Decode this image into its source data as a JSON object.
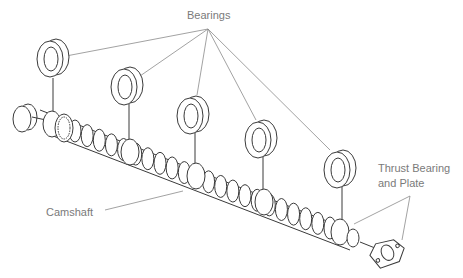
{
  "diagram": {
    "labels": {
      "bearings": "Bearings",
      "camshaft": "Camshaft",
      "thrust_line1": "Thrust Bearing",
      "thrust_line2": "and Plate"
    },
    "parts": [
      {
        "id": "bearing-1",
        "name": "Bearing"
      },
      {
        "id": "bearing-2",
        "name": "Bearing"
      },
      {
        "id": "bearing-3",
        "name": "Bearing"
      },
      {
        "id": "bearing-4",
        "name": "Bearing"
      },
      {
        "id": "bearing-5",
        "name": "Bearing"
      },
      {
        "id": "end-plug",
        "name": "Plug"
      },
      {
        "id": "camshaft",
        "name": "Camshaft"
      },
      {
        "id": "thrust-plate",
        "name": "Thrust Bearing and Plate"
      }
    ],
    "colors": {
      "ink": "#3a3a3a",
      "label": "#7a7a7a",
      "leader": "#8a8a8a",
      "background": "#ffffff"
    }
  }
}
